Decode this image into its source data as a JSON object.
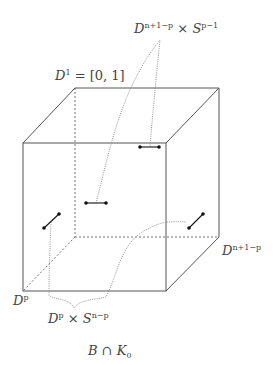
{
  "labels": {
    "top_product": {
      "base": "D",
      "sup1": "n+1−p",
      "times": " × ",
      "base2": "S",
      "sup2": "p−1"
    },
    "interval": {
      "base": "D",
      "sup": "1",
      "rest": " = [0, 1]"
    },
    "right_disk": {
      "base": "D",
      "sup": "n+1−p"
    },
    "left_disk": {
      "base": "D",
      "sup": "p"
    },
    "bottom_product": {
      "base": "D",
      "sup1": "p",
      "times": " × ",
      "base2": "S",
      "sup2": "n−p"
    },
    "caption": {
      "base": "B ∩ K",
      "sub": "0"
    }
  },
  "colors": {
    "edge": "#555555",
    "hidden_edge": "#777777",
    "curve": "#888888",
    "segment": "#111111",
    "label": "#444444"
  }
}
